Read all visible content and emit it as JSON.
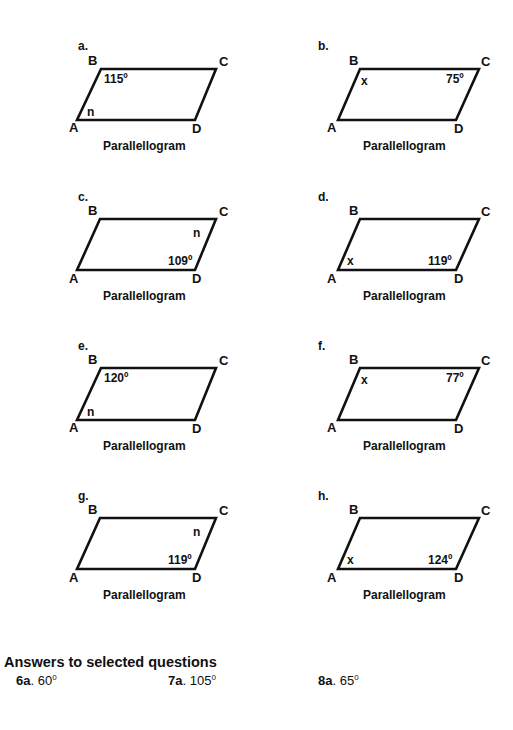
{
  "problems": [
    {
      "id": "a",
      "label": "a.",
      "vertices": {
        "A": "A",
        "B": "B",
        "C": "C",
        "D": "D"
      },
      "angle_B": "115º",
      "angle_A": "n",
      "caption": "Parallellogram"
    },
    {
      "id": "b",
      "label": "b.",
      "vertices": {
        "A": "A",
        "B": "B",
        "C": "C",
        "D": "D"
      },
      "angle_B": "x",
      "angle_C": "75º",
      "caption": "Parallellogram"
    },
    {
      "id": "c",
      "label": "c.",
      "vertices": {
        "A": "A",
        "B": "B",
        "C": "C",
        "D": "D"
      },
      "angle_C": "n",
      "angle_D": "109º",
      "caption": "Parallellogram"
    },
    {
      "id": "d",
      "label": "d.",
      "vertices": {
        "A": "A",
        "B": "B",
        "C": "C",
        "D": "D"
      },
      "angle_A": "x",
      "angle_D": "119º",
      "caption": "Parallellogram"
    },
    {
      "id": "e",
      "label": "e.",
      "vertices": {
        "A": "A",
        "B": "B",
        "C": "C",
        "D": "D"
      },
      "angle_B": "120º",
      "angle_A": "n",
      "caption": "Parallellogram"
    },
    {
      "id": "f",
      "label": "f.",
      "vertices": {
        "A": "A",
        "B": "B",
        "C": "C",
        "D": "D"
      },
      "angle_B": "x",
      "angle_C": "77º",
      "caption": "Parallellogram"
    },
    {
      "id": "g",
      "label": "g.",
      "vertices": {
        "A": "A",
        "B": "B",
        "C": "C",
        "D": "D"
      },
      "angle_C": "n",
      "angle_D": "119º",
      "caption": "Parallellogram"
    },
    {
      "id": "h",
      "label": "h.",
      "vertices": {
        "A": "A",
        "B": "B",
        "C": "C",
        "D": "D"
      },
      "angle_A": "x",
      "angle_D": "124º",
      "caption": "Parallellogram"
    }
  ],
  "answers": {
    "title": "Answers to selected questions",
    "items": [
      {
        "question": "6a",
        "sep": ".",
        "value": " 60",
        "unit": "0"
      },
      {
        "question": "7a",
        "sep": ".",
        "value": " 105",
        "unit": "0"
      },
      {
        "question": "8a",
        "sep": ".",
        "value": " 65",
        "unit": "0"
      }
    ]
  },
  "colors": {
    "ink": "#111111",
    "background": "#ffffff"
  }
}
